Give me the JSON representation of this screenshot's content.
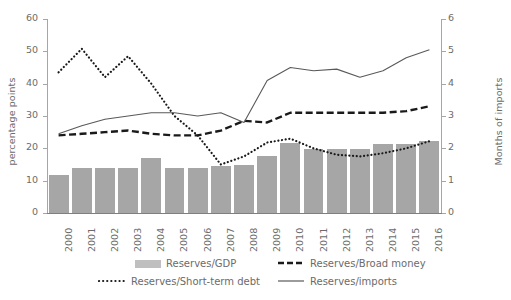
{
  "chart_data": {
    "type": "bar",
    "title": "",
    "categories": [
      "2000",
      "2001",
      "2002",
      "2003",
      "2004",
      "2005",
      "2006",
      "2007",
      "2008",
      "2009",
      "2010",
      "2011",
      "2012",
      "2013",
      "2014",
      "2015",
      "2016"
    ],
    "xlabel": "",
    "ylabel": "percentage points",
    "ylabel_secondary": "Months of imports",
    "ylim": [
      0,
      60
    ],
    "ylim_secondary": [
      0,
      6
    ],
    "yticks": [
      0,
      10,
      20,
      30,
      40,
      50,
      60
    ],
    "yticks_secondary": [
      0,
      1,
      2,
      3,
      4,
      5,
      6
    ],
    "grid": false,
    "legend_position": "bottom",
    "series": [
      {
        "name": "Reserves/GDP",
        "type": "bar",
        "axis": "left",
        "color": "#a6a6a6",
        "values": [
          11.8,
          13.9,
          13.9,
          13.9,
          17.0,
          14.0,
          14.0,
          14.6,
          15.0,
          17.5,
          21.7,
          19.8,
          19.8,
          19.8,
          21.3,
          21.3,
          22.2
        ]
      },
      {
        "name": "Reserves/Broad money",
        "type": "line",
        "style": "dashed",
        "axis": "right",
        "color": "#1a1a1a",
        "values": [
          2.4,
          2.45,
          2.5,
          2.55,
          2.45,
          2.4,
          2.4,
          2.55,
          2.85,
          2.8,
          3.1,
          3.1,
          3.1,
          3.1,
          3.1,
          3.15,
          3.3
        ]
      },
      {
        "name": "Reserves/Short-term debt",
        "type": "line",
        "style": "dotted",
        "axis": "left",
        "color": "#1a1a1a",
        "values": [
          43.5,
          50.8,
          42.0,
          48.5,
          40.0,
          30.0,
          24.0,
          15.0,
          17.5,
          21.8,
          23.0,
          20.0,
          18.0,
          17.5,
          18.5,
          20.0,
          22.2
        ]
      },
      {
        "name": "Reserves/imports",
        "type": "line",
        "style": "solid",
        "axis": "right",
        "color": "#595959",
        "values": [
          2.45,
          2.7,
          2.9,
          3.0,
          3.1,
          3.1,
          3.0,
          3.1,
          2.8,
          4.1,
          4.5,
          4.4,
          4.45,
          4.2,
          4.4,
          4.8,
          5.05
        ]
      }
    ]
  },
  "axes": {
    "left": {
      "title": "percentage points",
      "ticks": [
        "0",
        "10",
        "20",
        "30",
        "40",
        "50",
        "60"
      ]
    },
    "right": {
      "title": "Months of imports",
      "ticks": [
        "0",
        "1",
        "2",
        "3",
        "4",
        "5",
        "6"
      ]
    }
  },
  "legend": {
    "items": [
      {
        "label": "Reserves/GDP",
        "marker": "bar-swatch-icon"
      },
      {
        "label": "Reserves/Broad money",
        "marker": "dashed-line-icon"
      },
      {
        "label": "Reserves/Short-term debt",
        "marker": "dotted-line-icon"
      },
      {
        "label": "Reserves/imports",
        "marker": "solid-line-icon"
      }
    ]
  }
}
